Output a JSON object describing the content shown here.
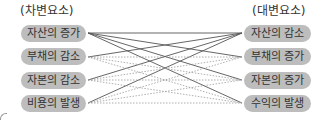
{
  "diagram": {
    "left_header": "(차변요소)",
    "right_header": "(대변요소)",
    "left_items": [
      {
        "label": "자산의 증가"
      },
      {
        "label": "부채의 감소"
      },
      {
        "label": "자본의 감소"
      },
      {
        "label": "비용의 발생"
      }
    ],
    "right_items": [
      {
        "label": "자산의 감소"
      },
      {
        "label": "부채의 증가"
      },
      {
        "label": "자본의 증가"
      },
      {
        "label": "수익의 발생"
      }
    ],
    "connections": {
      "solid": [
        [
          0,
          0
        ],
        [
          0,
          1
        ],
        [
          0,
          2
        ],
        [
          0,
          3
        ],
        [
          1,
          0
        ],
        [
          2,
          0
        ],
        [
          3,
          0
        ]
      ],
      "dotted": [
        [
          1,
          1
        ],
        [
          1,
          2
        ],
        [
          1,
          3
        ],
        [
          2,
          1
        ],
        [
          2,
          2
        ],
        [
          2,
          3
        ],
        [
          3,
          1
        ],
        [
          3,
          2
        ],
        [
          3,
          3
        ]
      ]
    },
    "colors": {
      "pill_fill": "#bdbdbd",
      "solid_line": "#555555",
      "dotted_line": "#9a9a9a"
    }
  }
}
